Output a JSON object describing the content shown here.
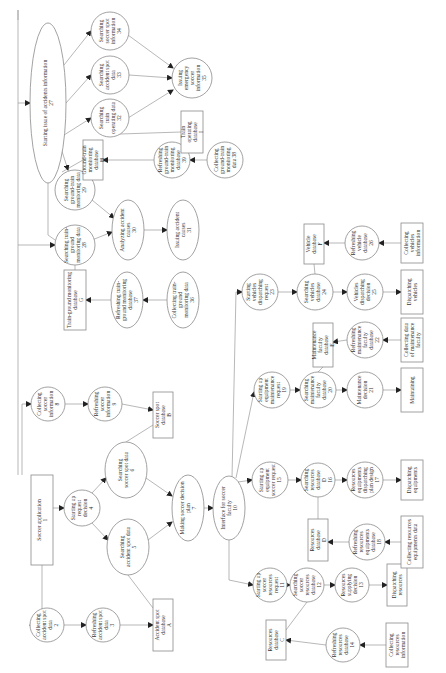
{
  "diagram": {
    "orientation": "rotated-90-ccw",
    "colors": {
      "background": "#ffffff",
      "stroke": "#8a8a8a",
      "edge": "#9a9a9a",
      "text": "#333333"
    },
    "nodes": [
      {
        "id": "n1",
        "shape": "rect",
        "cx": 42,
        "cy": 520,
        "w": 22,
        "h": 90,
        "lines": [
          "Soccer application",
          "1"
        ]
      },
      {
        "id": "n2",
        "shape": "circle",
        "cx": 47,
        "cy": 625,
        "r": 17,
        "lines": [
          "Collecting",
          "accident spot",
          "data",
          "2"
        ]
      },
      {
        "id": "n3",
        "shape": "circle",
        "cx": 103,
        "cy": 625,
        "r": 17,
        "lines": [
          "Refreshing",
          "accident spot",
          "data",
          "3"
        ]
      },
      {
        "id": "nA",
        "shape": "rect",
        "cx": 163,
        "cy": 625,
        "w": 20,
        "h": 52,
        "lines": [
          "Accident spot",
          "database",
          "A"
        ]
      },
      {
        "id": "n4",
        "shape": "circle",
        "cx": 82,
        "cy": 508,
        "r": 18,
        "lines": [
          "Starting up",
          "request",
          "decision",
          "4"
        ]
      },
      {
        "id": "n5",
        "shape": "ellipse",
        "cx": 128,
        "cy": 547,
        "rx": 21,
        "ry": 28,
        "lines": [
          "Searching",
          "accident spot data",
          "5"
        ]
      },
      {
        "id": "n6",
        "shape": "ellipse",
        "cx": 126,
        "cy": 470,
        "rx": 21,
        "ry": 28,
        "lines": [
          "Searching",
          "soccer spot data",
          "6"
        ]
      },
      {
        "id": "n7",
        "shape": "ellipse",
        "cx": 188,
        "cy": 508,
        "rx": 16,
        "ry": 33,
        "lines": [
          "Making soccer decision",
          "plan",
          "7"
        ]
      },
      {
        "id": "n8",
        "shape": "circle",
        "cx": 48,
        "cy": 404,
        "r": 17,
        "lines": [
          "Collecting",
          "soccer",
          "information",
          "8"
        ]
      },
      {
        "id": "n9",
        "shape": "circle",
        "cx": 105,
        "cy": 404,
        "r": 17,
        "lines": [
          "Refreshing",
          "soccer",
          "information",
          "9"
        ]
      },
      {
        "id": "nB",
        "shape": "rect",
        "cx": 163,
        "cy": 415,
        "w": 20,
        "h": 46,
        "lines": [
          "Soccer spot",
          "database",
          "B"
        ]
      },
      {
        "id": "n10",
        "shape": "ellipse",
        "cx": 229,
        "cy": 508,
        "rx": 16,
        "ry": 32,
        "lines": [
          "Interface for soccer",
          "faculty",
          "10"
        ]
      },
      {
        "id": "n11",
        "shape": "circle",
        "cx": 270,
        "cy": 585,
        "r": 17,
        "lines": [
          "Starting up",
          "soccer",
          "resources",
          "request",
          "11"
        ]
      },
      {
        "id": "n12",
        "shape": "circle",
        "cx": 307,
        "cy": 585,
        "r": 17,
        "lines": [
          "Searching",
          "soccer",
          "resources",
          "database",
          "12"
        ]
      },
      {
        "id": "n13",
        "shape": "circle",
        "cx": 352,
        "cy": 585,
        "r": 17,
        "lines": [
          "Resources",
          "supplying",
          "decision",
          "13"
        ]
      },
      {
        "id": "nRes",
        "shape": "rect",
        "cx": 397,
        "cy": 585,
        "w": 20,
        "h": 42,
        "lines": [
          "Dispatching",
          "resources"
        ]
      },
      {
        "id": "nC",
        "shape": "rect",
        "cx": 276,
        "cy": 640,
        "w": 20,
        "h": 40,
        "lines": [
          "Resources",
          "database",
          "C"
        ]
      },
      {
        "id": "n14",
        "shape": "circle",
        "cx": 343,
        "cy": 645,
        "r": 17,
        "lines": [
          "Refreshing",
          "resources",
          "database",
          "14"
        ]
      },
      {
        "id": "nColRes",
        "shape": "rect",
        "cx": 397,
        "cy": 645,
        "w": 22,
        "h": 44,
        "lines": [
          "Collecting",
          "resources",
          "information"
        ]
      },
      {
        "id": "n15",
        "shape": "circle",
        "cx": 270,
        "cy": 480,
        "r": 18,
        "lines": [
          "Starting up",
          "equipment",
          "soccer request",
          "15"
        ]
      },
      {
        "id": "n16",
        "shape": "circle",
        "cx": 318,
        "cy": 480,
        "r": 17,
        "lines": [
          "Searching",
          "resources",
          "database",
          "D",
          "16"
        ]
      },
      {
        "id": "n17",
        "shape": "circle",
        "cx": 365,
        "cy": 480,
        "r": 18,
        "lines": [
          "Resources",
          "equipments",
          "dispatching",
          "plan design",
          "17"
        ]
      },
      {
        "id": "nDispEq",
        "shape": "rect",
        "cx": 412,
        "cy": 480,
        "w": 22,
        "h": 40,
        "lines": [
          "Dispatching",
          "equipments"
        ]
      },
      {
        "id": "nD",
        "shape": "rect",
        "cx": 318,
        "cy": 540,
        "w": 20,
        "h": 42,
        "lines": [
          "Resources",
          "database",
          "D"
        ]
      },
      {
        "id": "n18",
        "shape": "circle",
        "cx": 367,
        "cy": 542,
        "r": 18,
        "lines": [
          "Refreshing",
          "resources",
          "equipments",
          "database",
          "18"
        ]
      },
      {
        "id": "nColEq",
        "shape": "rect",
        "cx": 412,
        "cy": 542,
        "w": 22,
        "h": 52,
        "lines": [
          "Collecting resources",
          "equipments data"
        ]
      },
      {
        "id": "n19",
        "shape": "circle",
        "cx": 272,
        "cy": 390,
        "r": 18,
        "lines": [
          "Starting up",
          "equipment",
          "maintenance",
          "request",
          "19"
        ]
      },
      {
        "id": "n20",
        "shape": "circle",
        "cx": 318,
        "cy": 390,
        "r": 18,
        "lines": [
          "Searching",
          "maintenance",
          "faculty",
          "database",
          "20"
        ]
      },
      {
        "id": "n21",
        "shape": "circle",
        "cx": 365,
        "cy": 390,
        "r": 18,
        "lines": [
          "Maintenance",
          "decision",
          "21"
        ]
      },
      {
        "id": "nMaint",
        "shape": "rect",
        "cx": 412,
        "cy": 390,
        "w": 22,
        "h": 44,
        "lines": [
          "Maintaining"
        ]
      },
      {
        "id": "nE",
        "shape": "rect",
        "cx": 323,
        "cy": 345,
        "w": 20,
        "h": 44,
        "lines": [
          "Maintenance",
          "faculty",
          "database",
          "E"
        ]
      },
      {
        "id": "n22",
        "shape": "circle",
        "cx": 365,
        "cy": 340,
        "r": 18,
        "lines": [
          "Refreshing",
          "maintenance",
          "faculty",
          "database",
          "22"
        ]
      },
      {
        "id": "nColMaint",
        "shape": "rect",
        "cx": 412,
        "cy": 340,
        "w": 22,
        "h": 44,
        "lines": [
          "Collecting data",
          "of maintenance",
          "faculty"
        ]
      },
      {
        "id": "n23",
        "shape": "circle",
        "cx": 260,
        "cy": 292,
        "r": 18,
        "lines": [
          "Starting",
          "vehicles",
          "dispatching",
          "request",
          "23"
        ]
      },
      {
        "id": "n24",
        "shape": "circle",
        "cx": 315,
        "cy": 292,
        "r": 18,
        "lines": [
          "Searching",
          "vehicles",
          "database",
          "24"
        ]
      },
      {
        "id": "n25",
        "shape": "circle",
        "cx": 365,
        "cy": 292,
        "r": 18,
        "lines": [
          "Vehicles",
          "dispatching",
          "decision",
          "25"
        ]
      },
      {
        "id": "nDispVeh",
        "shape": "rect",
        "cx": 412,
        "cy": 292,
        "w": 22,
        "h": 44,
        "lines": [
          "Dispatching",
          "vehicles"
        ]
      },
      {
        "id": "nF",
        "shape": "rect",
        "cx": 314,
        "cy": 244,
        "w": 20,
        "h": 40,
        "lines": [
          "Vehicle",
          "database",
          "F"
        ]
      },
      {
        "id": "n26",
        "shape": "circle",
        "cx": 362,
        "cy": 243,
        "r": 17,
        "lines": [
          "Refreshing",
          "vehicle",
          "database",
          "26"
        ]
      },
      {
        "id": "nColVeh",
        "shape": "rect",
        "cx": 412,
        "cy": 243,
        "w": 22,
        "h": 40,
        "lines": [
          "Collecting",
          "vehicles",
          "information"
        ]
      },
      {
        "id": "nG",
        "shape": "rect",
        "cx": 75,
        "cy": 300,
        "w": 22,
        "h": 60,
        "lines": [
          "Train-ground monitoring",
          "database",
          "G"
        ]
      },
      {
        "id": "n37",
        "shape": "ellipse",
        "cx": 127,
        "cy": 300,
        "rx": 16,
        "ry": 28,
        "lines": [
          "Refreshing train-",
          "ground monitoring",
          "database",
          "37"
        ]
      },
      {
        "id": "n36",
        "shape": "ellipse",
        "cx": 183,
        "cy": 300,
        "rx": 16,
        "ry": 28,
        "lines": [
          "Collecting train-",
          "ground",
          "monitoring data",
          "36"
        ]
      },
      {
        "id": "n28",
        "shape": "circle",
        "cx": 75,
        "cy": 245,
        "r": 20,
        "lines": [
          "Searching train-",
          "ground",
          "monitoring data",
          "28"
        ]
      },
      {
        "id": "n29",
        "shape": "circle",
        "cx": 75,
        "cy": 190,
        "r": 20,
        "lines": [
          "Searching",
          "ground-train",
          "monitoring data",
          "29"
        ]
      },
      {
        "id": "n30",
        "shape": "ellipse",
        "cx": 128,
        "cy": 230,
        "rx": 16,
        "ry": 30,
        "lines": [
          "Analyzing accident",
          "causes",
          "30"
        ]
      },
      {
        "id": "n31",
        "shape": "ellipse",
        "cx": 183,
        "cy": 230,
        "rx": 16,
        "ry": 30,
        "lines": [
          "Issuing accident",
          "causes",
          "31"
        ]
      },
      {
        "id": "nH",
        "shape": "rect",
        "cx": 93,
        "cy": 160,
        "w": 20,
        "h": 40,
        "lines": [
          "Ground-train",
          "monitoring",
          "database",
          "H"
        ]
      },
      {
        "id": "n38s",
        "shape": "circle",
        "cx": 172,
        "cy": 160,
        "r": 18,
        "lines": [
          "Refreshing",
          "ground-train",
          "monitoring",
          "database",
          "39"
        ]
      },
      {
        "id": "n38",
        "shape": "circle",
        "cx": 225,
        "cy": 160,
        "r": 18,
        "lines": [
          "Collecting",
          "ground-train",
          "monitoring",
          "data 38"
        ]
      },
      {
        "id": "n27",
        "shape": "ellipse",
        "cx": 48,
        "cy": 103,
        "rx": 18,
        "ry": 80,
        "lines": [
          "Starting issue of accidents information",
          "27"
        ]
      },
      {
        "id": "n32",
        "shape": "circle",
        "cx": 110,
        "cy": 118,
        "r": 19,
        "lines": [
          "Searching",
          "train",
          "operating data",
          "32"
        ]
      },
      {
        "id": "n33",
        "shape": "circle",
        "cx": 110,
        "cy": 75,
        "r": 19,
        "lines": [
          "Searching",
          "accident spot",
          "data",
          "33"
        ]
      },
      {
        "id": "n34",
        "shape": "circle",
        "cx": 110,
        "cy": 31,
        "r": 19,
        "lines": [
          "Searching",
          "soccer spot",
          "information",
          "34"
        ]
      },
      {
        "id": "n35",
        "shape": "circle",
        "cx": 192,
        "cy": 78,
        "r": 20,
        "lines": [
          "Issuing",
          "emergency",
          "soccer",
          "information",
          "35"
        ]
      },
      {
        "id": "nI",
        "shape": "rect",
        "cx": 192,
        "cy": 132,
        "w": 22,
        "h": 42,
        "lines": [
          "Train",
          "operating",
          "database",
          "I"
        ]
      }
    ],
    "edges": [
      {
        "d": "M42 565 L42 620 L30 625",
        "arrow": true
      },
      {
        "d": "M64 625 L86 625",
        "arrow": true
      },
      {
        "d": "M120 625 L153 625",
        "arrow": true
      },
      {
        "d": "M53 508 L64 508",
        "arrow": true
      },
      {
        "d": "M92 523 L108 540",
        "arrow": true
      },
      {
        "d": "M92 493 L106 478",
        "arrow": true
      },
      {
        "d": "M148 540 L172 522",
        "arrow": true
      },
      {
        "d": "M146 478 L172 496",
        "arrow": true
      },
      {
        "d": "M204 508 L213 508",
        "arrow": true
      },
      {
        "d": "M128 575 L153 608",
        "arrow": false
      },
      {
        "d": "M126 442 L153 425",
        "arrow": false
      },
      {
        "d": "M22 475 L22 404 L31 404",
        "arrow": true
      },
      {
        "d": "M65 404 L88 404",
        "arrow": true
      },
      {
        "d": "M122 404 L153 410",
        "arrow": true
      },
      {
        "d": "M18 475 L18 300 L18 10 L18 20",
        "arrow": false
      },
      {
        "d": "M18 103 L30 103",
        "arrow": true
      },
      {
        "d": "M18 245 L55 245",
        "arrow": true
      },
      {
        "d": "M229 540 L229 580 L253 585",
        "arrow": true
      },
      {
        "d": "M287 585 L290 585",
        "arrow": true
      },
      {
        "d": "M324 585 L335 585",
        "arrow": true
      },
      {
        "d": "M369 585 L387 585",
        "arrow": true
      },
      {
        "d": "M307 602 L286 630",
        "arrow": false
      },
      {
        "d": "M326 645 L286 640",
        "arrow": true
      },
      {
        "d": "M386 645 L360 645",
        "arrow": true
      },
      {
        "d": "M238 482 L252 480",
        "arrow": true
      },
      {
        "d": "M288 480 L301 480",
        "arrow": true
      },
      {
        "d": "M335 480 L347 480",
        "arrow": true
      },
      {
        "d": "M383 480 L401 480",
        "arrow": true
      },
      {
        "d": "M318 497 L318 519",
        "arrow": false
      },
      {
        "d": "M349 542 L328 542",
        "arrow": true
      },
      {
        "d": "M401 542 L385 542",
        "arrow": true
      },
      {
        "d": "M236 478 L254 392",
        "arrow": true
      },
      {
        "d": "M290 390 L300 390",
        "arrow": true
      },
      {
        "d": "M336 390 L347 390",
        "arrow": true
      },
      {
        "d": "M383 390 L401 390",
        "arrow": true
      },
      {
        "d": "M318 372 L323 367",
        "arrow": false
      },
      {
        "d": "M347 340 L333 342",
        "arrow": true
      },
      {
        "d": "M401 340 L383 340",
        "arrow": true
      },
      {
        "d": "M232 478 L236 292 L242 292",
        "arrow": true
      },
      {
        "d": "M278 292 L297 292",
        "arrow": true
      },
      {
        "d": "M333 292 L347 292",
        "arrow": true
      },
      {
        "d": "M383 292 L401 292",
        "arrow": true
      },
      {
        "d": "M315 274 L314 264",
        "arrow": false
      },
      {
        "d": "M345 243 L324 243",
        "arrow": true
      },
      {
        "d": "M401 243 L379 243",
        "arrow": true
      },
      {
        "d": "M75 265 L75 270",
        "arrow": false
      },
      {
        "d": "M111 300 L86 300",
        "arrow": true
      },
      {
        "d": "M167 300 L143 300",
        "arrow": true
      },
      {
        "d": "M92 240 L112 232",
        "arrow": true
      },
      {
        "d": "M92 200 L114 218",
        "arrow": true
      },
      {
        "d": "M144 230 L167 230",
        "arrow": true
      },
      {
        "d": "M62 172 L83 160",
        "arrow": false
      },
      {
        "d": "M60 145 L68 170",
        "arrow": true
      },
      {
        "d": "M154 160 L103 160",
        "arrow": true
      },
      {
        "d": "M207 160 L190 160",
        "arrow": true
      },
      {
        "d": "M64 135 L91 118",
        "arrow": true
      },
      {
        "d": "M66 103 L91 75",
        "arrow": true
      },
      {
        "d": "M64 65 L91 31",
        "arrow": true
      },
      {
        "d": "M128 118 L173 90",
        "arrow": true
      },
      {
        "d": "M129 75 L172 78",
        "arrow": true
      },
      {
        "d": "M128 35 L173 68",
        "arrow": true
      },
      {
        "d": "M120 134 L181 132",
        "arrow": false
      },
      {
        "d": "M48 183 L48 235 L55 240",
        "arrow": false
      }
    ]
  }
}
